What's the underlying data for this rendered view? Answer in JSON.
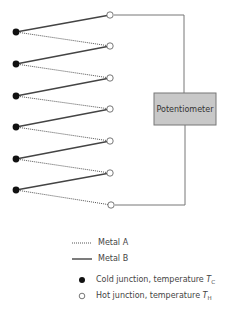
{
  "diagram": {
    "potentiometer_label": "Potentiometer",
    "cold_junctions": [
      {
        "x": 16,
        "y": 32
      },
      {
        "x": 16,
        "y": 64
      },
      {
        "x": 16,
        "y": 96
      },
      {
        "x": 16,
        "y": 127
      },
      {
        "x": 16,
        "y": 159
      },
      {
        "x": 16,
        "y": 190
      }
    ],
    "hot_junctions": [
      {
        "x": 110,
        "y": 15
      },
      {
        "x": 110,
        "y": 46
      },
      {
        "x": 110,
        "y": 78
      },
      {
        "x": 110,
        "y": 109
      },
      {
        "x": 110,
        "y": 141
      },
      {
        "x": 110,
        "y": 173
      },
      {
        "x": 111,
        "y": 205
      }
    ],
    "colors": {
      "wire": "#555555",
      "potentiometer_fill": "#c8c8c8",
      "potentiometer_border": "#777777"
    }
  },
  "legend": {
    "metal_a": "Metal A",
    "metal_b": "Metal B",
    "cold_prefix": "Cold junction, temperature ",
    "cold_symbol": "T",
    "cold_sub": "C",
    "hot_prefix": "Hot junction, temperature ",
    "hot_symbol": "T",
    "hot_sub": "H"
  }
}
